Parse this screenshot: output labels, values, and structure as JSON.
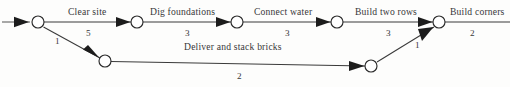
{
  "diagram": {
    "type": "activity-on-arrow-network",
    "title": "",
    "nodes": [
      {
        "id": "n1",
        "x": 38,
        "y": 22,
        "r": 6
      },
      {
        "id": "n2",
        "x": 137,
        "y": 22,
        "r": 6
      },
      {
        "id": "n3",
        "x": 237,
        "y": 22,
        "r": 6
      },
      {
        "id": "n4",
        "x": 337,
        "y": 22,
        "r": 6
      },
      {
        "id": "n5",
        "x": 439,
        "y": 22,
        "r": 6
      },
      {
        "id": "n6",
        "x": 105,
        "y": 61,
        "r": 6
      },
      {
        "id": "n7",
        "x": 371,
        "y": 66,
        "r": 6
      }
    ],
    "edges": [
      {
        "id": "e0",
        "from": "start",
        "to": "n1",
        "label": "",
        "duration": ""
      },
      {
        "id": "e1",
        "from": "n1",
        "to": "n2",
        "label": "Clear site",
        "duration": "5"
      },
      {
        "id": "e2",
        "from": "n2",
        "to": "n3",
        "label": "Dig foundations",
        "duration": "3"
      },
      {
        "id": "e3",
        "from": "n3",
        "to": "n4",
        "label": "Connect water",
        "duration": "3"
      },
      {
        "id": "e4",
        "from": "n4",
        "to": "n5",
        "label": "Build two rows",
        "duration": "3"
      },
      {
        "id": "e5",
        "from": "n5",
        "to": "end",
        "label": "Build corners",
        "duration": "2"
      },
      {
        "id": "e6",
        "from": "n1",
        "to": "n6",
        "label": "",
        "duration": "1"
      },
      {
        "id": "e7",
        "from": "n6",
        "to": "n7",
        "label": "Deliver and stack bricks",
        "duration": "2"
      },
      {
        "id": "e8",
        "from": "n7",
        "to": "n5",
        "label": "",
        "duration": "1"
      }
    ],
    "labels": {
      "clear_site": "Clear site",
      "clear_site_duration": "5",
      "dig_foundations": "Dig foundations",
      "dig_foundations_duration": "3",
      "connect_water": "Connect water",
      "connect_water_duration": "3",
      "build_two_rows": "Build two rows",
      "build_two_rows_duration": "3",
      "build_corners": "Build corners",
      "build_corners_duration": "2",
      "deliver_and_stack_bricks": "Deliver and stack bricks",
      "deliver_and_stack_bricks_duration": "2",
      "branch_down_duration": "1",
      "branch_up_duration": "1"
    },
    "colors": {
      "line": "#3a3a3a",
      "node_fill": "#ffffff",
      "node_stroke": "#2b2b2b",
      "text": "#38383a",
      "background": "#fdfdfc"
    }
  }
}
